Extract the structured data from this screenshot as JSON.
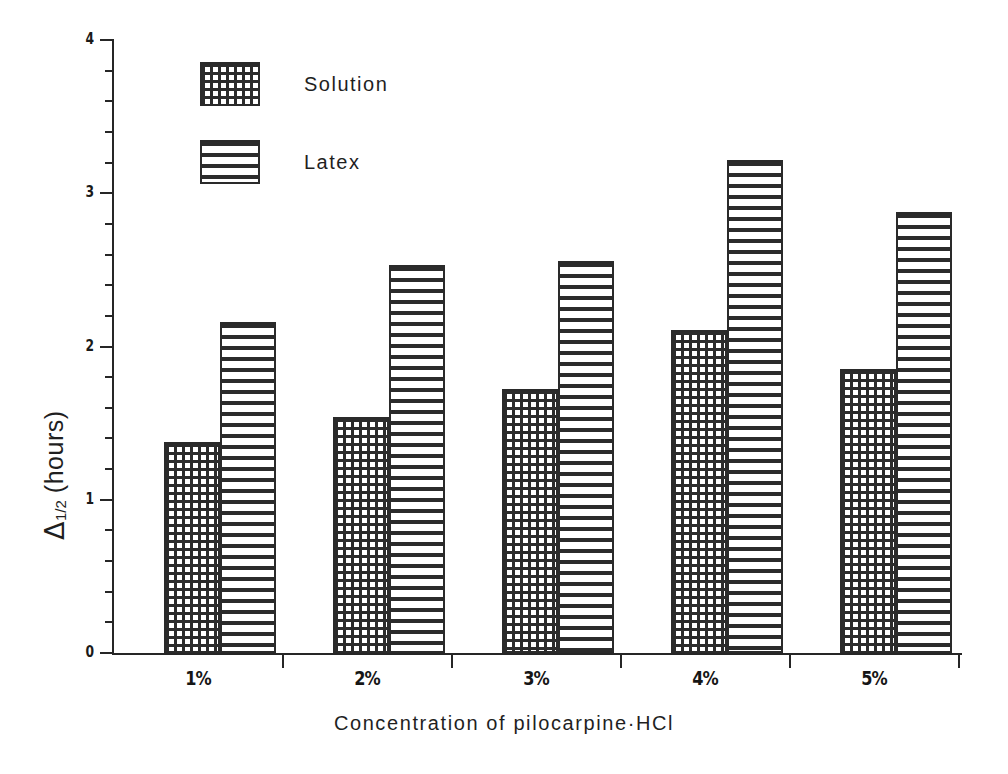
{
  "chart_data": {
    "type": "bar",
    "title": "",
    "xlabel": "Concentration of pilocarpine·HCl",
    "ylabel": "Δ 1/2 (hours)",
    "ylabel_parts": {
      "symbol": "Δ",
      "subscript": "1/2",
      "units": "(hours)"
    },
    "categories": [
      "1%",
      "2%",
      "3%",
      "4%",
      "5%"
    ],
    "series": [
      {
        "name": "Solution",
        "pattern": "cross-hatch-grid",
        "values": [
          1.38,
          1.54,
          1.72,
          2.11,
          1.85
        ]
      },
      {
        "name": "Latex",
        "pattern": "horizontal-lines",
        "values": [
          2.16,
          2.53,
          2.56,
          3.22,
          2.88
        ]
      }
    ],
    "ylim": [
      0,
      4
    ],
    "ytick_labels": [
      "0",
      "1",
      "2",
      "3",
      "4"
    ],
    "ytick_values": [
      0,
      1,
      2,
      3,
      4
    ],
    "yminor_step": 0.2,
    "grid": false,
    "legend_position": "upper-left-inside",
    "axis_color": "#262626",
    "bar_edge_color": "#2a2a2a",
    "background": "#ffffff"
  },
  "legend": {
    "items": [
      {
        "label": "Solution"
      },
      {
        "label": "Latex"
      }
    ]
  },
  "axes": {
    "x_title": "Concentration of pilocarpine·HCl",
    "y_ticks": [
      {
        "label": "4",
        "value": 4
      },
      {
        "label": "3",
        "value": 3
      },
      {
        "label": "2",
        "value": 2
      },
      {
        "label": "1",
        "value": 1
      },
      {
        "label": "0",
        "value": 0
      }
    ],
    "x_ticks": [
      {
        "label": "1%"
      },
      {
        "label": "2%"
      },
      {
        "label": "3%"
      },
      {
        "label": "4%"
      },
      {
        "label": "5%"
      }
    ]
  }
}
